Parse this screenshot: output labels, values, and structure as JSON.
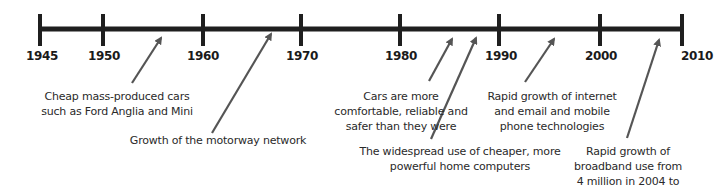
{
  "timeline": {
    "line_color": "#1f1f1f",
    "arrow_color": "#555555",
    "years": [
      {
        "label": "1945",
        "x": 40
      },
      {
        "label": "1950",
        "x": 103
      },
      {
        "label": "1960",
        "x": 203
      },
      {
        "label": "1970",
        "x": 301
      },
      {
        "label": "1980",
        "x": 400
      },
      {
        "label": "1990",
        "x": 499
      },
      {
        "label": "2000",
        "x": 600
      },
      {
        "label": "2010",
        "x": 682
      }
    ],
    "events": [
      {
        "text": "Cheap mass-produced cars\nsuch as Ford Anglia and Mini",
        "label_x": 117,
        "label_y": 91
      },
      {
        "text": "Growth of the motorway network",
        "label_x": 218,
        "label_y": 136
      },
      {
        "text": "Cars are more\ncomfortable, reliable and\nsafer than they were",
        "label_x": 400,
        "label_y": 91
      },
      {
        "text": "The widespread use of cheaper, more\npowerful home computers",
        "label_x": 460,
        "label_y": 146
      },
      {
        "text": "Rapid growth of internet\nand email and mobile\nphone technologies",
        "label_x": 552,
        "label_y": 91
      },
      {
        "text": "Rapid growth of\nbroadband use from\n4 million in 2004 to",
        "label_x": 628,
        "label_y": 146
      }
    ]
  }
}
